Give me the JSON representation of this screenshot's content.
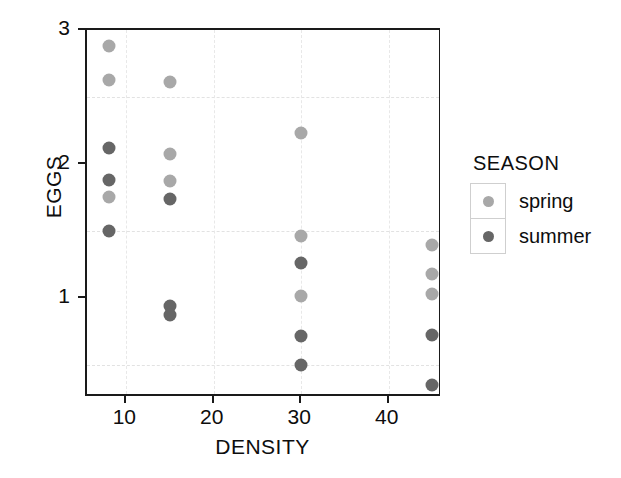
{
  "chart_data": {
    "type": "scatter",
    "title": "",
    "xlabel": "DENSITY",
    "ylabel": "EGGS",
    "xlim": [
      5.5,
      46.1
    ],
    "ylim": [
      0.25,
      3.0
    ],
    "xticks": [
      10,
      20,
      30,
      40
    ],
    "yticks": [
      1,
      2,
      3
    ],
    "grid": true,
    "gridlines_y": [
      0.5,
      1.5,
      2.5
    ],
    "gridlines_x": [
      10,
      20,
      30,
      40
    ],
    "legend_title": "SEASON",
    "legend_position": "right",
    "series": [
      {
        "name": "spring",
        "color": "#a8a8a8",
        "points": [
          {
            "x": 8,
            "y": 2.88
          },
          {
            "x": 8,
            "y": 2.63
          },
          {
            "x": 8,
            "y": 1.75
          },
          {
            "x": 15,
            "y": 2.61
          },
          {
            "x": 15,
            "y": 2.07
          },
          {
            "x": 15,
            "y": 1.87
          },
          {
            "x": 30,
            "y": 2.23
          },
          {
            "x": 30,
            "y": 1.46
          },
          {
            "x": 30,
            "y": 1.01
          },
          {
            "x": 45,
            "y": 1.39
          },
          {
            "x": 45,
            "y": 1.18
          },
          {
            "x": 45,
            "y": 1.03
          }
        ]
      },
      {
        "name": "summer",
        "color": "#666666",
        "points": [
          {
            "x": 8,
            "y": 2.12
          },
          {
            "x": 8,
            "y": 1.88
          },
          {
            "x": 8,
            "y": 1.5
          },
          {
            "x": 15,
            "y": 1.74
          },
          {
            "x": 15,
            "y": 0.94
          },
          {
            "x": 15,
            "y": 0.87
          },
          {
            "x": 30,
            "y": 1.26
          },
          {
            "x": 30,
            "y": 0.71
          },
          {
            "x": 30,
            "y": 0.5
          },
          {
            "x": 45,
            "y": 0.72
          },
          {
            "x": 45,
            "y": 0.35
          }
        ]
      }
    ]
  },
  "axes": {
    "ylabel": "EGGS",
    "xlabel": "DENSITY",
    "ytick_labels": [
      "3",
      "2",
      "1"
    ],
    "xtick_labels": [
      "10",
      "20",
      "30",
      "40"
    ]
  },
  "legend": {
    "title": "SEASON",
    "entries": [
      {
        "label": "spring",
        "color": "#a8a8a8"
      },
      {
        "label": "summer",
        "color": "#666666"
      }
    ]
  }
}
